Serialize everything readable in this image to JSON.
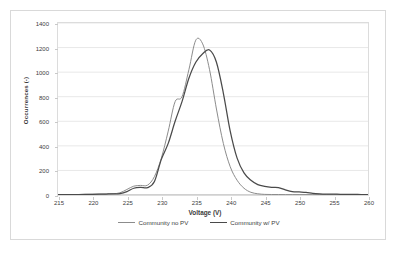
{
  "chart_data": {
    "type": "line",
    "title": "",
    "xlabel": "Voltage (V)",
    "ylabel": "Occurrences (-)",
    "xlim": [
      215,
      260
    ],
    "ylim": [
      0,
      1400
    ],
    "xticks": [
      215,
      220,
      225,
      230,
      235,
      240,
      245,
      250,
      255,
      260
    ],
    "yticks": [
      0,
      200,
      400,
      600,
      800,
      1000,
      1200,
      1400
    ],
    "grid": "horizontal",
    "legend_position": "bottom",
    "colors": {
      "series_1": "#8c8c8c",
      "series_2": "#4a4a4a",
      "gridline": "#e8e8e8",
      "axis": "#dcdcdc",
      "text": "#404040"
    },
    "x": [
      215,
      216,
      217,
      218,
      219,
      220,
      221,
      222,
      223,
      224,
      225,
      226,
      227,
      228,
      229,
      230,
      231,
      232,
      233,
      234,
      235,
      236,
      237,
      238,
      239,
      240,
      241,
      242,
      243,
      244,
      245,
      246,
      247,
      248,
      249,
      250,
      251,
      252,
      253,
      254,
      255,
      256,
      257,
      258,
      259,
      260
    ],
    "series": [
      {
        "name": "Community no PV",
        "color": "#8c8c8c",
        "peak_x": 235,
        "peak_y": 1260,
        "values": [
          4,
          4,
          4,
          4,
          5,
          6,
          7,
          8,
          10,
          18,
          45,
          72,
          78,
          80,
          150,
          300,
          520,
          760,
          800,
          1020,
          1260,
          1230,
          1020,
          700,
          420,
          230,
          120,
          55,
          22,
          10,
          5,
          4,
          4,
          3,
          3,
          3,
          3,
          3,
          3,
          3,
          3,
          3,
          3,
          3,
          3,
          3
        ]
      },
      {
        "name": "Community w/ PV",
        "color": "#4a4a4a",
        "peak_x": 237,
        "peak_y": 1180,
        "values": [
          4,
          4,
          4,
          4,
          5,
          6,
          7,
          8,
          9,
          12,
          28,
          55,
          62,
          60,
          110,
          290,
          420,
          600,
          760,
          950,
          1080,
          1150,
          1180,
          1080,
          830,
          520,
          300,
          180,
          120,
          85,
          70,
          62,
          60,
          42,
          28,
          25,
          22,
          14,
          10,
          8,
          7,
          6,
          5,
          5,
          4,
          4
        ]
      }
    ]
  },
  "legend": {
    "items": [
      {
        "label": "Community no PV",
        "color": "#8c8c8c"
      },
      {
        "label": "Community w/ PV",
        "color": "#4a4a4a"
      }
    ]
  }
}
